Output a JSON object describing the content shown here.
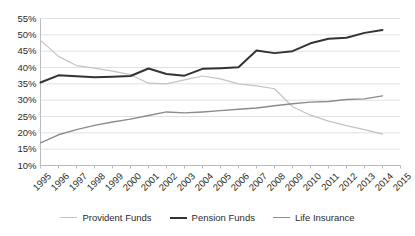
{
  "chart_data": {
    "type": "line",
    "title": "",
    "xlabel": "",
    "ylabel": "",
    "grid": true,
    "legend_position": "bottom",
    "ylim": [
      10,
      55
    ],
    "ytick_step": 5,
    "ytick_labels": [
      "55%",
      "50%",
      "45%",
      "40%",
      "35%",
      "30%",
      "25%",
      "20%",
      "15%",
      "10%"
    ],
    "ytick_values": [
      55,
      50,
      45,
      40,
      35,
      30,
      25,
      20,
      15,
      10
    ],
    "categories": [
      "1995",
      "1996",
      "1997",
      "1998",
      "1999",
      "2000",
      "2001",
      "2002",
      "2003",
      "2004",
      "2005",
      "2006",
      "2007",
      "2008",
      "2009",
      "2010",
      "2011",
      "2012",
      "2013",
      "2014",
      "2015"
    ],
    "series": [
      {
        "name": "Provident Funds",
        "color": "#c3c3c3",
        "width": 1.2,
        "values": [
          48.3,
          43.4,
          40.6,
          39.8,
          38.9,
          37.8,
          35.2,
          35.0,
          36.2,
          37.4,
          36.5,
          35.0,
          34.4,
          33.5,
          28.0,
          25.4,
          23.6,
          22.2,
          21.0,
          19.6,
          null
        ]
      },
      {
        "name": "Pension Funds",
        "color": "#333333",
        "width": 2.0,
        "values": [
          35.4,
          37.6,
          37.3,
          37.0,
          37.2,
          37.4,
          39.7,
          38.0,
          37.5,
          39.6,
          39.8,
          40.1,
          45.2,
          44.4,
          45.0,
          47.4,
          48.8,
          49.1,
          50.6,
          51.5,
          null
        ]
      },
      {
        "name": "Life Insurance",
        "color": "#8c8c8c",
        "width": 1.4,
        "values": [
          16.9,
          19.4,
          21.0,
          22.3,
          23.3,
          24.2,
          25.3,
          26.4,
          26.1,
          26.4,
          26.8,
          27.2,
          27.6,
          28.3,
          28.9,
          29.4,
          29.6,
          30.2,
          30.4,
          31.3,
          null
        ]
      }
    ]
  },
  "legend": {
    "items": [
      {
        "label": "Provident Funds",
        "color": "#c3c3c3",
        "thickness": 1.5
      },
      {
        "label": "Pension Funds",
        "color": "#333333",
        "thickness": 2.4
      },
      {
        "label": "Life Insurance",
        "color": "#8c8c8c",
        "thickness": 1.8
      }
    ]
  }
}
